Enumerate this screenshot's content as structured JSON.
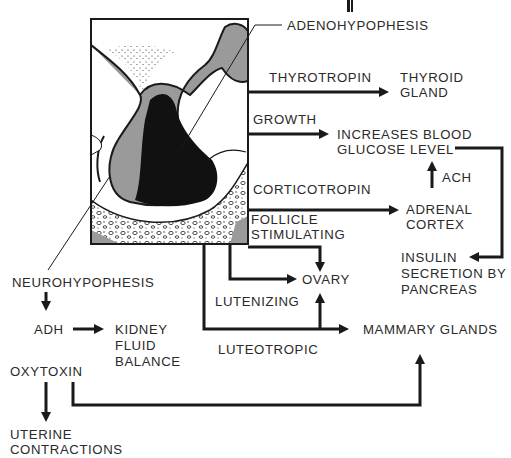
{
  "diagram": {
    "title_partial": "",
    "structures": {
      "adenohypophesis": "ADENOHYPOPHESIS",
      "neurohypophesis": "NEUROHYPOPHESIS"
    },
    "hormones": {
      "thyrotropin": "THYROTROPIN",
      "growth": "GROWTH",
      "corticotropin": "CORTICOTROPIN",
      "follicle_line1": "FOLLICLE",
      "follicle_line2": "STIMULATING",
      "lutenizing": "LUTENIZING",
      "luteotropic": "LUTEOTROPIC",
      "adh": "ADH",
      "oxytoxin": "OXYTOXIN",
      "ach": "ACH"
    },
    "targets": {
      "thyroid_line1": "THYROID",
      "thyroid_line2": "GLAND",
      "glucose_line1": "INCREASES BLOOD",
      "glucose_line2": "GLUCOSE LEVEL",
      "adrenal_line1": "ADRENAL",
      "adrenal_line2": "CORTEX",
      "insulin_line1": "INSULIN",
      "insulin_line2": "SECRETION BY",
      "insulin_line3": "PANCREAS",
      "ovary": "OVARY",
      "mammary": "MAMMARY GLANDS",
      "kidney_line1": "KIDNEY",
      "kidney_line2": "FLUID",
      "kidney_line3": "BALANCE",
      "uterine_line1": "UTERINE",
      "uterine_line2": "CONTRACTIONS"
    },
    "colors": {
      "ink": "#1a1a1a",
      "gray_tissue": "#9a9a9a",
      "background": "#ffffff"
    }
  }
}
